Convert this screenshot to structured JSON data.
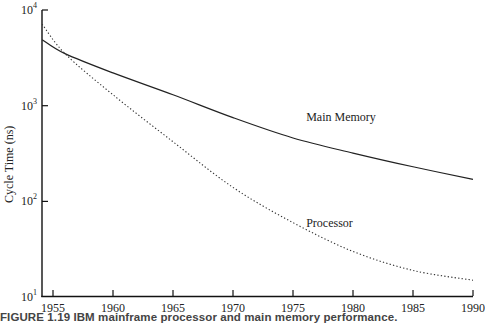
{
  "chart_data": {
    "type": "line",
    "title": "",
    "caption": "FIGURE 1.19 IBM mainframe processor and main memory performance.",
    "xlabel": "",
    "ylabel": "Cycle Time (ns)",
    "yscale": "log",
    "xlim": [
      1954.1,
      1990
    ],
    "ylim": [
      10,
      10000
    ],
    "x_ticks": [
      1955,
      1960,
      1965,
      1970,
      1975,
      1980,
      1985,
      1990
    ],
    "y_ticks": [
      {
        "value": 10,
        "base": "10",
        "exp": "1"
      },
      {
        "value": 100,
        "base": "10",
        "exp": "2"
      },
      {
        "value": 1000,
        "base": "10",
        "exp": "3"
      },
      {
        "value": 10000,
        "base": "10",
        "exp": "4"
      }
    ],
    "grid": false,
    "legend": "inline labels",
    "x": [
      1954.1,
      1956,
      1960,
      1965,
      1970,
      1975,
      1980,
      1985,
      1990
    ],
    "series": [
      {
        "name": "Main Memory",
        "style": "solid",
        "values": [
          4900,
          3500,
          2200,
          1300,
          750,
          460,
          320,
          230,
          170
        ],
        "label_pos": {
          "x": 1976.1,
          "y": 700
        }
      },
      {
        "name": "Processor",
        "style": "dotted",
        "values": [
          7100,
          3500,
          1300,
          420,
          140,
          60,
          30,
          19,
          15
        ],
        "label_pos": {
          "x": 1976.1,
          "y": 54
        }
      }
    ]
  }
}
